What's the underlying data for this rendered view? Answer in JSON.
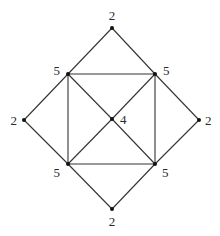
{
  "diagram": {
    "type": "graph",
    "nodes": [
      {
        "id": "top",
        "x": 112,
        "y": 28,
        "label": "2",
        "lx": 112,
        "ly": 20,
        "anchor": "middle"
      },
      {
        "id": "ul",
        "x": 68,
        "y": 74,
        "label": "5",
        "lx": 60,
        "ly": 75,
        "anchor": "end"
      },
      {
        "id": "ur",
        "x": 155,
        "y": 74,
        "label": "5",
        "lx": 163,
        "ly": 75,
        "anchor": "start"
      },
      {
        "id": "left",
        "x": 24,
        "y": 120,
        "label": "2",
        "lx": 17,
        "ly": 125,
        "anchor": "end"
      },
      {
        "id": "center",
        "x": 112,
        "y": 119,
        "label": "4",
        "lx": 120,
        "ly": 124,
        "anchor": "start"
      },
      {
        "id": "right",
        "x": 199,
        "y": 120,
        "label": "2",
        "lx": 205,
        "ly": 125,
        "anchor": "start"
      },
      {
        "id": "ll",
        "x": 68,
        "y": 164,
        "label": "5",
        "lx": 60,
        "ly": 177,
        "anchor": "end"
      },
      {
        "id": "lr",
        "x": 155,
        "y": 164,
        "label": "5",
        "lx": 162,
        "ly": 177,
        "anchor": "start"
      },
      {
        "id": "bottom",
        "x": 112,
        "y": 209,
        "label": "2",
        "lx": 112,
        "ly": 226,
        "anchor": "middle"
      }
    ],
    "edges": [
      [
        "top",
        "ul"
      ],
      [
        "top",
        "ur"
      ],
      [
        "ul",
        "left"
      ],
      [
        "ur",
        "right"
      ],
      [
        "left",
        "ll"
      ],
      [
        "right",
        "lr"
      ],
      [
        "ll",
        "bottom"
      ],
      [
        "lr",
        "bottom"
      ],
      [
        "ul",
        "ur"
      ],
      [
        "ll",
        "lr"
      ],
      [
        "ul",
        "ll"
      ],
      [
        "ur",
        "lr"
      ],
      [
        "ul",
        "center"
      ],
      [
        "ur",
        "center"
      ],
      [
        "ll",
        "center"
      ],
      [
        "lr",
        "center"
      ]
    ]
  }
}
